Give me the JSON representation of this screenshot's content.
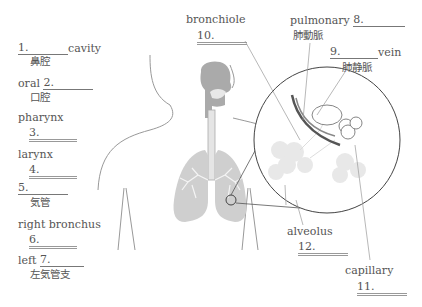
{
  "labels": [
    {
      "id": "1",
      "pre": "",
      "num": "1.",
      "post": "cavity",
      "jp": "鼻腔"
    },
    {
      "id": "2",
      "pre": "oral ",
      "num": "2.",
      "post": "",
      "jp": "口腔"
    },
    {
      "id": "3",
      "pre": "",
      "num": "3.",
      "post": "",
      "en": "pharynx"
    },
    {
      "id": "4",
      "pre": "",
      "num": "4.",
      "post": "",
      "en": "larynx"
    },
    {
      "id": "5",
      "pre": "",
      "num": "5.",
      "post": "",
      "jp": "気管"
    },
    {
      "id": "6",
      "pre": "",
      "num": "6.",
      "post": "",
      "en": "right bronchus"
    },
    {
      "id": "7",
      "pre": "left ",
      "num": "7.",
      "post": "",
      "jp": "左気管支"
    },
    {
      "id": "8",
      "pre": "pulmonary ",
      "num": "8.",
      "post": "",
      "jp": "肺動脈"
    },
    {
      "id": "9",
      "pre": "",
      "num": "9.",
      "post": "vein",
      "jp": "肺静脈"
    },
    {
      "id": "10",
      "pre": "",
      "num": "10.",
      "post": "",
      "en": "bronchiole"
    },
    {
      "id": "11",
      "pre": "",
      "num": "11.",
      "post": "",
      "en": "capillary"
    },
    {
      "id": "12",
      "pre": "",
      "num": "12.",
      "post": "",
      "en": "alveolus"
    }
  ],
  "colors": {
    "line": "#777777",
    "lung": "#c8c8c8",
    "airway": "#a8a8a8",
    "vessel": "#555555"
  }
}
